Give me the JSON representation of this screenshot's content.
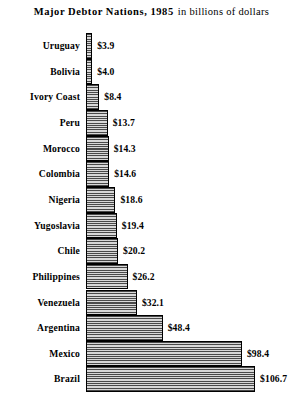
{
  "title": {
    "main": "Major Debtor Nations, 1985",
    "sub": "in billions of dollars"
  },
  "chart_data": {
    "type": "bar",
    "orientation": "horizontal",
    "xlabel": "",
    "ylabel": "",
    "unit": "billions of dollars",
    "currency_symbol": "$",
    "grid": false,
    "legend": null,
    "xlim": [
      0,
      106.7
    ],
    "categories": [
      "Uruguay",
      "Bolivia",
      "Ivory Coast",
      "Peru",
      "Morocco",
      "Colombia",
      "Nigeria",
      "Yugoslavia",
      "Chile",
      "Philippines",
      "Venezuela",
      "Argentina",
      "Mexico",
      "Brazil"
    ],
    "values": [
      3.9,
      4.0,
      8.4,
      13.7,
      14.3,
      14.6,
      18.6,
      19.4,
      20.2,
      26.2,
      32.1,
      48.4,
      98.4,
      106.7
    ],
    "value_labels": [
      "$3.9",
      "$4.0",
      "$8.4",
      "$13.7",
      "$14.3",
      "$14.6",
      "$18.6",
      "$19.4",
      "$20.2",
      "$26.2",
      "$32.1",
      "$48.4",
      "$98.4",
      "$106.7"
    ],
    "bar_fill": "#b9b9b9",
    "bar_hatch": "horizontal-lines",
    "bar_edge_color": "#000000",
    "background": "#ffffff"
  }
}
